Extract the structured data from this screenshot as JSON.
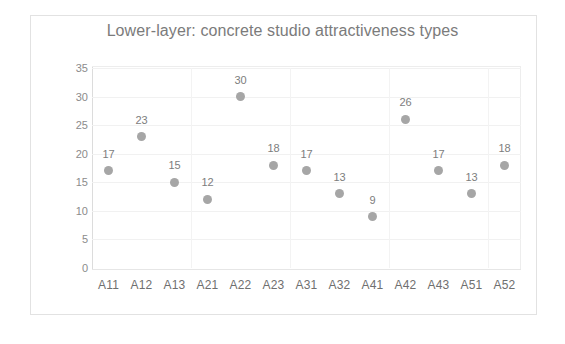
{
  "chart_data": {
    "type": "scatter",
    "title": "Lower-layer: concrete studio attractiveness types",
    "xlabel": "",
    "ylabel": "NUMBER OF PREFERENCE",
    "categories": [
      "A11",
      "A12",
      "A13",
      "A21",
      "A22",
      "A23",
      "A31",
      "A32",
      "A41",
      "A42",
      "A43",
      "A51",
      "A52"
    ],
    "values": [
      17,
      23,
      15,
      12,
      30,
      18,
      17,
      13,
      9,
      26,
      17,
      13,
      18
    ],
    "data_labels": [
      "17",
      "23",
      "15",
      "12",
      "30",
      "18",
      "17",
      "13",
      "9",
      "26",
      "17",
      "13",
      "18"
    ],
    "ylim": [
      0,
      35
    ],
    "yticks": [
      "0",
      "5",
      "10",
      "15",
      "20",
      "25",
      "30",
      "35"
    ],
    "grid": true,
    "legend": "none",
    "marker_color": "#a6a6a6",
    "text_color": "#7b7b7b"
  }
}
